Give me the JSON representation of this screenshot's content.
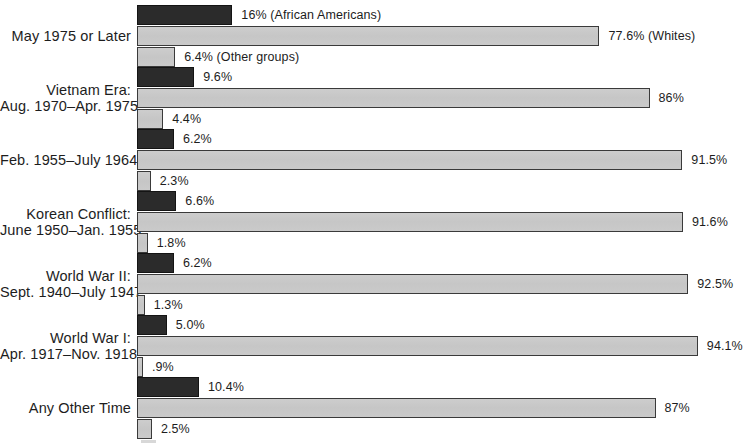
{
  "chart_data": {
    "type": "bar",
    "orientation": "horizontal",
    "title": "",
    "subtitle": "",
    "xlabel": "",
    "ylabel": "",
    "xlim": [
      0,
      100
    ],
    "grid": false,
    "legend_position": "inline-annotations",
    "units": "percent",
    "categories": [
      "May 1975 or Later",
      "Vietnam Era: Aug. 1970–Apr. 1975",
      "Feb. 1955–July 1964",
      "Korean Conflict: June 1950–Jan. 1955",
      "World War II: Sept. 1940–July 1947",
      "World War I: Apr. 1917–Nov. 1918",
      "Any Other Time"
    ],
    "series": [
      {
        "name": "African Americans",
        "color": "#2b2b2b",
        "values": [
          16.0,
          9.6,
          6.2,
          6.6,
          6.2,
          5.0,
          10.4
        ]
      },
      {
        "name": "Whites",
        "color": "#c9c9c9",
        "values": [
          77.6,
          86.0,
          91.5,
          91.6,
          92.5,
          94.1,
          87.0
        ]
      },
      {
        "name": "Other groups",
        "color": "#c9c9c9",
        "values": [
          6.4,
          4.4,
          2.3,
          1.8,
          1.3,
          0.9,
          2.5
        ]
      }
    ],
    "annotations": [
      "16% (African Americans)",
      "77.6% (Whites)",
      "6.4% (Other groups)"
    ]
  },
  "groups": [
    {
      "label_lines": [
        "May 1975 or Later"
      ],
      "bars": [
        {
          "series": "African Americans",
          "value": 16.0,
          "label": "16% (African Americans)"
        },
        {
          "series": "Whites",
          "value": 77.6,
          "label": "77.6% (Whites)"
        },
        {
          "series": "Other groups",
          "value": 6.4,
          "label": "6.4% (Other groups)"
        }
      ]
    },
    {
      "label_lines": [
        "Vietnam Era:",
        "Aug. 1970–Apr. 1975"
      ],
      "bars": [
        {
          "series": "African Americans",
          "value": 9.6,
          "label": "9.6%"
        },
        {
          "series": "Whites",
          "value": 86.0,
          "label": "86%"
        },
        {
          "series": "Other groups",
          "value": 4.4,
          "label": "4.4%"
        }
      ]
    },
    {
      "label_lines": [
        "Feb. 1955–July 1964"
      ],
      "bars": [
        {
          "series": "African Americans",
          "value": 6.2,
          "label": "6.2%"
        },
        {
          "series": "Whites",
          "value": 91.5,
          "label": "91.5%"
        },
        {
          "series": "Other groups",
          "value": 2.3,
          "label": "2.3%"
        }
      ]
    },
    {
      "label_lines": [
        "Korean Conflict:",
        "June 1950–Jan. 1955"
      ],
      "bars": [
        {
          "series": "African Americans",
          "value": 6.6,
          "label": "6.6%"
        },
        {
          "series": "Whites",
          "value": 91.6,
          "label": "91.6%"
        },
        {
          "series": "Other groups",
          "value": 1.8,
          "label": "1.8%"
        }
      ]
    },
    {
      "label_lines": [
        "World War II:",
        "Sept. 1940–July 1947"
      ],
      "bars": [
        {
          "series": "African Americans",
          "value": 6.2,
          "label": "6.2%"
        },
        {
          "series": "Whites",
          "value": 92.5,
          "label": "92.5%"
        },
        {
          "series": "Other groups",
          "value": 1.3,
          "label": "1.3%"
        }
      ]
    },
    {
      "label_lines": [
        "World War I:",
        "Apr. 1917–Nov. 1918"
      ],
      "bars": [
        {
          "series": "African Americans",
          "value": 5.0,
          "label": "5.0%"
        },
        {
          "series": "Whites",
          "value": 94.1,
          "label": "94.1%"
        },
        {
          "series": "Other groups",
          "value": 0.9,
          "label": ".9%"
        }
      ]
    },
    {
      "label_lines": [
        "Any Other Time"
      ],
      "bars": [
        {
          "series": "African Americans",
          "value": 10.4,
          "label": "10.4%"
        },
        {
          "series": "Whites",
          "value": 87.0,
          "label": "87%"
        },
        {
          "series": "Other groups",
          "value": 2.5,
          "label": "2.5%"
        }
      ]
    }
  ],
  "layout": {
    "bar_origin_x": 137,
    "px_per_percent": 5.96,
    "group_top_start": 5,
    "group_spacing": 62,
    "bar_height": 20,
    "bar_gap": 1
  },
  "colors": {
    "dark_series": "#2b2b2b",
    "light_series": "#c9c9c9",
    "bar_outline": "#333333",
    "shadow": "#d8d8d8",
    "text": "#1d1d1d",
    "background": "#ffffff"
  }
}
